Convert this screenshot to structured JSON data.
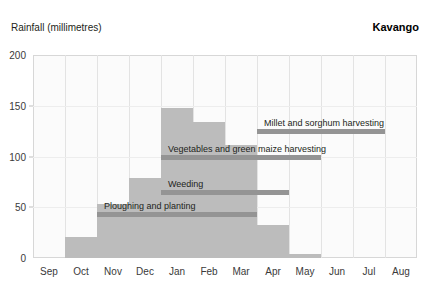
{
  "header": {
    "axis_label": "Rainfall (millimetres)",
    "region_title": "Kavango"
  },
  "chart_data": {
    "type": "bar",
    "title": "Kavango",
    "xlabel": "",
    "ylabel": "Rainfall (millimetres)",
    "ylim": [
      0,
      200
    ],
    "yticks": [
      0,
      50,
      100,
      150,
      200
    ],
    "ytick_labels": [
      "0",
      "50",
      "100",
      "150",
      "200"
    ],
    "grid": true,
    "legend": "none",
    "bar_color": "#bcbcbc",
    "annotation_color": "#949494",
    "categories": [
      "Sep",
      "Oct",
      "Nov",
      "Dec",
      "Jan",
      "Feb",
      "Mar",
      "Apr",
      "May",
      "Jun",
      "Jul",
      "Aug"
    ],
    "values": [
      0,
      21,
      53,
      79,
      148,
      134,
      111,
      33,
      4,
      0,
      0,
      0
    ],
    "annotations": [
      {
        "label": "Ploughing and planting",
        "start_month": "Nov",
        "end_month": "Mar",
        "start_index": 2,
        "end_index": 7,
        "level": 45,
        "text_align": "left"
      },
      {
        "label": "Weeding",
        "start_month": "Jan",
        "end_month": "Apr",
        "start_index": 4,
        "end_index": 8,
        "level": 67,
        "text_align": "left"
      },
      {
        "label": "Vegetables and green maize harvesting",
        "start_month": "Jan",
        "end_month": "May",
        "start_index": 4,
        "end_index": 9,
        "level": 101,
        "text_align": "left"
      },
      {
        "label": "Millet and sorghum harvesting",
        "start_month": "Apr",
        "end_month": "Jul",
        "start_index": 7,
        "end_index": 11,
        "level": 127,
        "text_align": "left"
      }
    ]
  }
}
